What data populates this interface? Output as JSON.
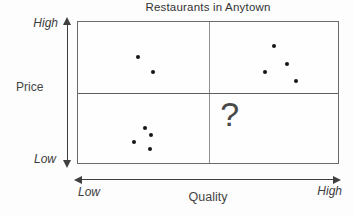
{
  "figure": {
    "title": "Restaurants in Anytown",
    "colors": {
      "dot": "#161616",
      "border": "#6a6a6a",
      "divider": "#8e8e8e",
      "arrow": "#3f3f3f",
      "text": "#3a3a3a"
    }
  },
  "axes": {
    "y": {
      "label": "Price",
      "top_label": "High",
      "bottom_label": "Low"
    },
    "x": {
      "label": "Quality",
      "left_label": "Low",
      "right_label": "High"
    }
  },
  "annotation": {
    "question_mark": "?"
  },
  "chart_data": {
    "type": "scatter",
    "title": "Restaurants in Anytown",
    "xlabel": "Quality",
    "ylabel": "Price",
    "x_scale": [
      "Low",
      "High"
    ],
    "y_scale": [
      "Low",
      "High"
    ],
    "xlim": [
      0,
      1
    ],
    "ylim": [
      0,
      1
    ],
    "grid": "2x2 quadrant dividers at x=0.5 and y=0.5",
    "legend": "none",
    "series": [
      {
        "name": "high-price-low-quality",
        "points": [
          [
            0.229,
            0.755
          ],
          [
            0.29,
            0.643
          ]
        ]
      },
      {
        "name": "high-price-high-quality",
        "points": [
          [
            0.752,
            0.832
          ],
          [
            0.802,
            0.699
          ],
          [
            0.721,
            0.643
          ],
          [
            0.84,
            0.58
          ]
        ]
      },
      {
        "name": "low-price-low-quality",
        "points": [
          [
            0.256,
            0.245
          ],
          [
            0.282,
            0.196
          ],
          [
            0.214,
            0.147
          ],
          [
            0.275,
            0.098
          ]
        ]
      },
      {
        "name": "low-price-high-quality",
        "points": [],
        "annotation": {
          "text": "?",
          "x": 0.584,
          "y": 0.35
        }
      }
    ]
  }
}
